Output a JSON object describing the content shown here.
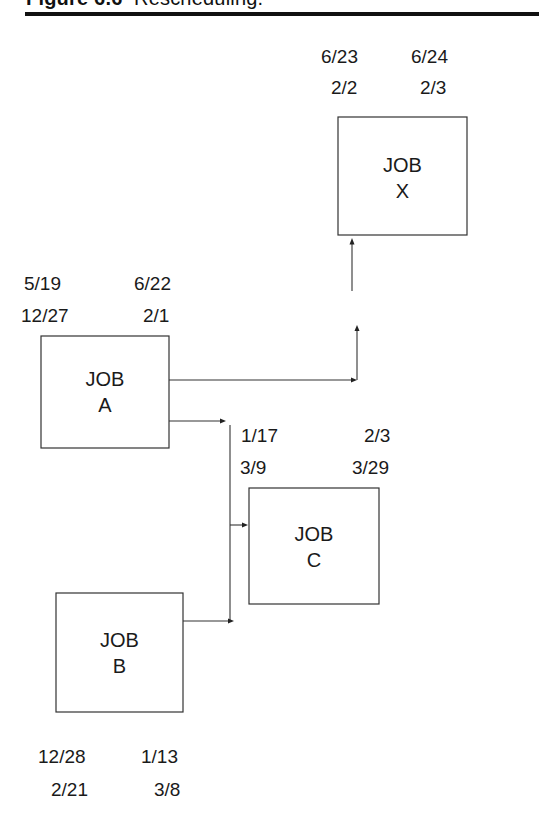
{
  "figure": {
    "number": "Figure 6.6",
    "caption": "Rescheduling."
  },
  "jobs": {
    "x": {
      "line1": "JOB",
      "line2": "X",
      "dates_top_left": "6/23",
      "dates_top_right": "6/24",
      "dates_bottom_left": "2/2",
      "dates_bottom_right": "2/3"
    },
    "a": {
      "line1": "JOB",
      "line2": "A",
      "dates_top_left": "5/19",
      "dates_top_right": "6/22",
      "dates_bottom_left": "12/27",
      "dates_bottom_right": "2/1"
    },
    "c": {
      "line1": "JOB",
      "line2": "C",
      "dates_top_left": "1/17",
      "dates_top_right": "2/3",
      "dates_bottom_left": "3/9",
      "dates_bottom_right": "3/29"
    },
    "b": {
      "line1": "JOB",
      "line2": "B",
      "dates_top_left": "12/28",
      "dates_top_right": "1/13",
      "dates_bottom_left": "2/21",
      "dates_bottom_right": "3/8"
    }
  },
  "edges": [
    {
      "from": "JOB A",
      "to": "JOB X"
    },
    {
      "from": "JOB A",
      "to": "JOB C"
    },
    {
      "from": "JOB B",
      "to": "JOB C"
    }
  ]
}
